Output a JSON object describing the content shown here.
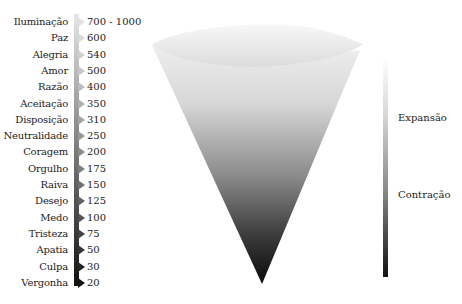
{
  "scale": {
    "rows": [
      {
        "label": "Iluminação",
        "value": "700 - 1000",
        "shade": "#e2e2e2"
      },
      {
        "label": "Paz",
        "value": "600",
        "shade": "#dadada"
      },
      {
        "label": "Alegria",
        "value": "540",
        "shade": "#d0d0d0"
      },
      {
        "label": "Amor",
        "value": "500",
        "shade": "#c6c6c6"
      },
      {
        "label": "Razão",
        "value": "400",
        "shade": "#bcbcbc"
      },
      {
        "label": "Aceitação",
        "value": "350",
        "shade": "#b0b0b0"
      },
      {
        "label": "Disposição",
        "value": "310",
        "shade": "#a4a4a4"
      },
      {
        "label": "Neutralidade",
        "value": "250",
        "shade": "#989898"
      },
      {
        "label": "Coragem",
        "value": "200",
        "shade": "#8c8c8c"
      },
      {
        "label": "Orgulho",
        "value": "175",
        "shade": "#7e7e7e"
      },
      {
        "label": "Raiva",
        "value": "150",
        "shade": "#707070"
      },
      {
        "label": "Desejo",
        "value": "125",
        "shade": "#626262"
      },
      {
        "label": "Medo",
        "value": "100",
        "shade": "#545454"
      },
      {
        "label": "Tristeza",
        "value": "75",
        "shade": "#444444"
      },
      {
        "label": "Apatia",
        "value": "50",
        "shade": "#343434"
      },
      {
        "label": "Culpa",
        "value": "30",
        "shade": "#242424"
      },
      {
        "label": "Vergonha",
        "value": "20",
        "shade": "#141414"
      }
    ]
  },
  "legend": {
    "top_label": "Expansão",
    "bottom_label": "Contração"
  },
  "colors": {
    "light": "#f0f0f0",
    "dark": "#0a0a0a"
  }
}
